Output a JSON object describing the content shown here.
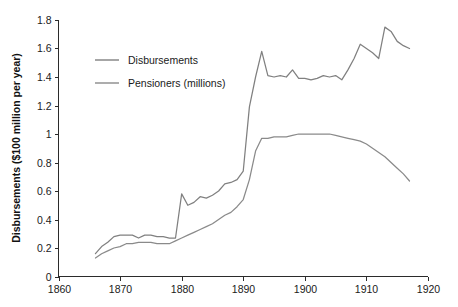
{
  "chart_data": {
    "type": "line",
    "title": "",
    "subtitle": "",
    "xlabel": "",
    "ylabel": "Disbursements ($100 million per year)",
    "xlim": [
      1860,
      1920
    ],
    "ylim": [
      0,
      1.8
    ],
    "grid": false,
    "legend_position": "upper-left-inside",
    "xticks": [
      1860,
      1870,
      1880,
      1890,
      1900,
      1910,
      1920
    ],
    "xtick_labels": [
      "1860",
      "1870",
      "1880",
      "1890",
      "1900",
      "1910",
      "1920"
    ],
    "yticks": [
      0,
      0.2,
      0.4,
      0.6,
      0.8,
      1,
      1.2,
      1.4,
      1.6,
      1.8
    ],
    "ytick_labels": [
      "0",
      "0.2",
      "0.4",
      "0.6",
      "0.8",
      "1",
      "1.2",
      "1.4",
      "1.6",
      "1.8"
    ],
    "x": [
      1866,
      1867,
      1868,
      1869,
      1870,
      1871,
      1872,
      1873,
      1874,
      1875,
      1876,
      1877,
      1878,
      1879,
      1880,
      1881,
      1882,
      1883,
      1884,
      1885,
      1886,
      1887,
      1888,
      1889,
      1890,
      1891,
      1892,
      1893,
      1894,
      1895,
      1896,
      1897,
      1898,
      1899,
      1900,
      1901,
      1902,
      1903,
      1904,
      1905,
      1906,
      1907,
      1908,
      1909,
      1910,
      1911,
      1912,
      1913,
      1914,
      1915,
      1916,
      1917
    ],
    "series": [
      {
        "name": "Disbursements",
        "color": "#808080",
        "values": [
          0.16,
          0.21,
          0.24,
          0.28,
          0.29,
          0.29,
          0.29,
          0.27,
          0.29,
          0.29,
          0.28,
          0.28,
          0.27,
          0.27,
          0.58,
          0.5,
          0.52,
          0.56,
          0.55,
          0.57,
          0.6,
          0.65,
          0.66,
          0.68,
          0.74,
          1.19,
          1.4,
          1.58,
          1.41,
          1.4,
          1.41,
          1.4,
          1.45,
          1.39,
          1.39,
          1.38,
          1.39,
          1.41,
          1.4,
          1.41,
          1.38,
          1.45,
          1.53,
          1.63,
          1.6,
          1.57,
          1.53,
          1.75,
          1.72,
          1.65,
          1.62,
          1.6
        ]
      },
      {
        "name": "Pensioners (millions)",
        "color": "#8a8a8a",
        "values": [
          0.13,
          0.16,
          0.18,
          0.2,
          0.21,
          0.23,
          0.23,
          0.24,
          0.24,
          0.24,
          0.23,
          0.23,
          0.23,
          0.25,
          0.27,
          0.29,
          0.31,
          0.33,
          0.35,
          0.37,
          0.4,
          0.43,
          0.45,
          0.49,
          0.54,
          0.68,
          0.88,
          0.97,
          0.97,
          0.98,
          0.98,
          0.98,
          0.99,
          1.0,
          1.0,
          1.0,
          1.0,
          1.0,
          1.0,
          0.99,
          0.98,
          0.97,
          0.96,
          0.95,
          0.93,
          0.9,
          0.87,
          0.84,
          0.8,
          0.76,
          0.72,
          0.67
        ]
      }
    ]
  },
  "legend": {
    "items": [
      {
        "label": "Disbursements",
        "color": "#808080"
      },
      {
        "label": "Pensioners (millions)",
        "color": "#8a8a8a"
      }
    ]
  },
  "axes": {
    "y_title": "Disbursements ($100 million per year)"
  }
}
